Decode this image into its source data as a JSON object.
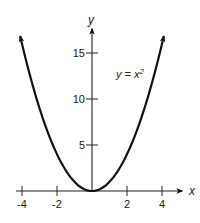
{
  "chart_data": {
    "type": "line",
    "title": "",
    "xlabel": "x",
    "ylabel": "y",
    "xlim": [
      -4,
      4
    ],
    "ylim": [
      0,
      16
    ],
    "grid": false,
    "legend": null,
    "x_ticks": [
      -4,
      -2,
      2,
      4
    ],
    "x_tick_labels": [
      "-4",
      "-2",
      "2",
      "4"
    ],
    "y_ticks": [
      5,
      10,
      15
    ],
    "y_tick_labels": [
      "5",
      "10",
      "15"
    ],
    "annotations": [
      {
        "text": "y = x²",
        "x": 2.9,
        "y": 12.5
      }
    ],
    "series": [
      {
        "name": "y = x²",
        "x": [
          -4.1,
          -4,
          -3.5,
          -3,
          -2.5,
          -2,
          -1.5,
          -1,
          -0.5,
          0,
          0.5,
          1,
          1.5,
          2,
          2.5,
          3,
          3.5,
          4,
          4.1
        ],
        "values": [
          16.81,
          16,
          12.25,
          9,
          6.25,
          4,
          2.25,
          1,
          0.25,
          0,
          0.25,
          1,
          2.25,
          4,
          6.25,
          9,
          12.25,
          16,
          16.81
        ],
        "color": "#111111"
      }
    ]
  },
  "labels": {
    "x_axis": "x",
    "y_axis": "y",
    "equation": "y = x",
    "equation_exp": "2"
  }
}
